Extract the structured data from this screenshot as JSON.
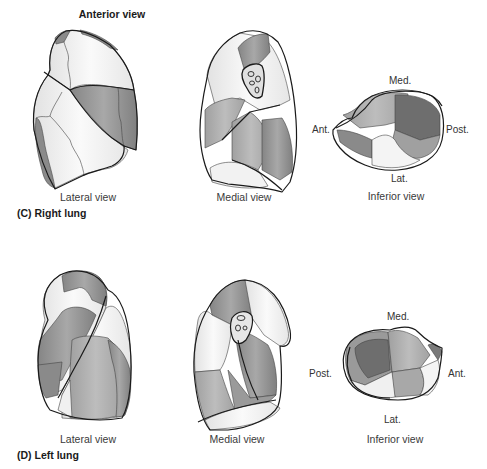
{
  "heading": "Anterior view",
  "panels": [
    {
      "id": "C",
      "label": "(C)  Right lung",
      "views": [
        {
          "name": "lateral",
          "label": "Lateral view"
        },
        {
          "name": "medial",
          "label": "Medial view"
        },
        {
          "name": "inferior",
          "label": "Inferior view",
          "directions": {
            "top": "Med.",
            "left": "Ant.",
            "right": "Post.",
            "bottom": "Lat."
          }
        }
      ]
    },
    {
      "id": "D",
      "label": "(D)  Left lung",
      "views": [
        {
          "name": "lateral",
          "label": "Lateral view"
        },
        {
          "name": "medial",
          "label": "Medial view"
        },
        {
          "name": "inferior",
          "label": "Inferior view",
          "directions": {
            "top": "Med.",
            "left": "Post.",
            "right": "Ant.",
            "bottom": "Lat."
          }
        }
      ]
    }
  ],
  "colors": {
    "light": "#ececec",
    "lighter": "#f6f6f6",
    "mid": "#b4b4b4",
    "dark": "#8c8c8c",
    "darker": "#7a7a7a",
    "outline": "#1a1a1a"
  }
}
